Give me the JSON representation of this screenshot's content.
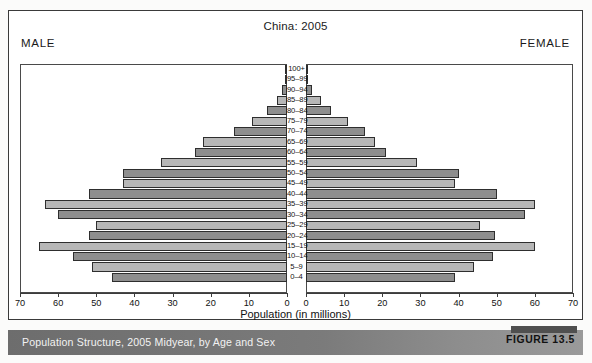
{
  "figure": {
    "title": "China: 2005",
    "male_label": "MALE",
    "female_label": "FEMALE",
    "caption": "Population Structure, 2005 Midyear, by Age and Sex",
    "figure_number": "FIGURE 13.5"
  },
  "colors": {
    "bar_dark": "#8e8e8e",
    "bar_light": "#b7b7b7",
    "bar_border": "#2e2e2e",
    "caption_bar": "#7b7b7b",
    "frame": "#3a3a3a"
  },
  "chart_data": {
    "type": "bar",
    "title": "China: 2005",
    "subtitle": "Population Structure, 2005 Midyear, by Age and Sex",
    "xlabel": "Population (in millions)",
    "ylabel": "",
    "orientation": "horizontal",
    "layout": "population-pyramid",
    "grid": false,
    "legend_position": "none",
    "xlim_left": [
      70,
      0
    ],
    "xlim_right": [
      0,
      70
    ],
    "xticks_left": [
      "70",
      "60",
      "50",
      "40",
      "30",
      "20",
      "10",
      "0"
    ],
    "xticks_right": [
      "0",
      "10",
      "20",
      "30",
      "40",
      "50",
      "60",
      "70"
    ],
    "xtick_values": [
      0,
      10,
      20,
      30,
      40,
      50,
      60,
      70
    ],
    "categories": [
      "100+",
      "95–99",
      "90–94",
      "85–89",
      "80–84",
      "75–79",
      "70–74",
      "65–69",
      "60–64",
      "55–59",
      "50–54",
      "45–49",
      "40–44",
      "35–39",
      "30–34",
      "25–29",
      "20–24",
      "15–19",
      "10–14",
      "5–9",
      "0–4"
    ],
    "series": [
      {
        "name": "MALE",
        "side": "left",
        "values": [
          0.1,
          0.4,
          1.2,
          2.6,
          5.2,
          9.2,
          14.0,
          22.0,
          24.0,
          33.0,
          43.0,
          43.0,
          52.0,
          63.5,
          60.0,
          50.0,
          52.0,
          65.0,
          56.0,
          51.0,
          46.0
        ]
      },
      {
        "name": "FEMALE",
        "side": "right",
        "values": [
          0.1,
          0.6,
          1.7,
          4.0,
          6.6,
          11.0,
          15.5,
          18.0,
          21.0,
          29.0,
          40.0,
          39.0,
          50.0,
          60.0,
          57.5,
          45.5,
          49.5,
          60.0,
          49.0,
          44.0,
          39.0
        ]
      }
    ],
    "shade_pattern": [
      "dark",
      "light"
    ]
  }
}
